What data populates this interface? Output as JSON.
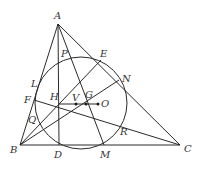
{
  "diagram": {
    "colors": {
      "stroke": "#2a2a2a",
      "label": "#333333",
      "background": "#ffffff"
    },
    "points": {
      "A": {
        "label": "A",
        "x": 58,
        "y": 24
      },
      "B": {
        "label": "B",
        "x": 20,
        "y": 145
      },
      "C": {
        "label": "C",
        "x": 180,
        "y": 145
      },
      "D": {
        "label": "D",
        "x": 59,
        "y": 145
      },
      "M": {
        "label": "M",
        "x": 104,
        "y": 145
      },
      "E": {
        "label": "E",
        "x": 101,
        "y": 60
      },
      "N": {
        "label": "N",
        "x": 119,
        "y": 80
      },
      "F": {
        "label": "F",
        "x": 34,
        "y": 100
      },
      "L": {
        "label": "L",
        "x": 38,
        "y": 87
      },
      "P": {
        "label": "P",
        "x": 59,
        "y": 59
      },
      "Q": {
        "label": "Q",
        "x": 38,
        "y": 123
      },
      "R": {
        "label": "R",
        "x": 120,
        "y": 124
      },
      "H": {
        "label": "H",
        "x": 59,
        "y": 104
      },
      "V": {
        "label": "V",
        "x": 76,
        "y": 104
      },
      "G": {
        "label": "G",
        "x": 86,
        "y": 104
      },
      "O": {
        "label": "O",
        "x": 98,
        "y": 104
      }
    },
    "circle": {
      "name": "nine-point circle",
      "cx": 81,
      "cy": 103,
      "r": 46
    }
  }
}
